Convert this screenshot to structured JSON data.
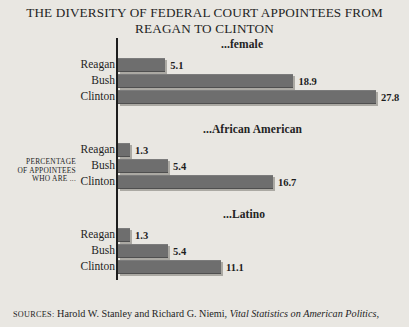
{
  "title": {
    "line1": "THE DIVERSITY OF FEDERAL COURT APPOINTEES FROM",
    "line2": "REAGAN TO CLINTON"
  },
  "y_axis_caption": {
    "line1": "PERCENTAGE",
    "line2": "OF APPOINTEES",
    "line3": "WHO ARE ..."
  },
  "source": {
    "label": "SOURCES:",
    "authors": "Harold W. Stanley and Richard G. Niemi,",
    "work": "Vital Statistics on American Politics,"
  },
  "chart_data": {
    "type": "bar",
    "orientation": "horizontal",
    "title": "THE DIVERSITY OF FEDERAL COURT APPOINTEES FROM REAGAN TO CLINTON",
    "xlabel": "",
    "ylabel": "PERCENTAGE OF APPOINTEES WHO ARE ...",
    "categories": [
      "Reagan",
      "Bush",
      "Clinton"
    ],
    "xlim": [
      0,
      30
    ],
    "grid": false,
    "legend": "none",
    "units": "percent",
    "bar_color": "#6e6e6e",
    "px_per_unit": 9.28,
    "groups": [
      {
        "label": "...female",
        "values": [
          5.1,
          18.9,
          27.8
        ],
        "bars": [
          {
            "category": "Reagan",
            "value": 5.1,
            "value_label": "5.1"
          },
          {
            "category": "Bush",
            "value": 18.9,
            "value_label": "18.9"
          },
          {
            "category": "Clinton",
            "value": 27.8,
            "value_label": "27.8"
          }
        ]
      },
      {
        "label": "...African American",
        "values": [
          1.3,
          5.4,
          16.7
        ],
        "bars": [
          {
            "category": "Reagan",
            "value": 1.3,
            "value_label": "1.3"
          },
          {
            "category": "Bush",
            "value": 5.4,
            "value_label": "5.4"
          },
          {
            "category": "Clinton",
            "value": 16.7,
            "value_label": "16.7"
          }
        ]
      },
      {
        "label": "...Latino",
        "values": [
          1.3,
          5.4,
          11.1
        ],
        "bars": [
          {
            "category": "Reagan",
            "value": 1.3,
            "value_label": "1.3"
          },
          {
            "category": "Bush",
            "value": 5.4,
            "value_label": "5.4"
          },
          {
            "category": "Clinton",
            "value": 11.1,
            "value_label": "11.1"
          }
        ]
      }
    ]
  }
}
